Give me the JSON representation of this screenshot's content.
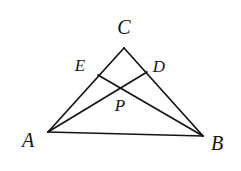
{
  "figure": {
    "type": "geometry-diagram",
    "background_color": "#ffffff",
    "ink_color": "#141414",
    "stroke_width": 1.7,
    "canvas": {
      "width": 241,
      "height": 171
    },
    "points": {
      "A": {
        "label": "A",
        "x": 48,
        "y": 132,
        "label_x": 28,
        "label_y": 140
      },
      "B": {
        "label": "B",
        "x": 203,
        "y": 136,
        "label_x": 217,
        "label_y": 143
      },
      "C": {
        "label": "C",
        "x": 124,
        "y": 48,
        "label_x": 124,
        "label_y": 27
      },
      "D": {
        "label": "D",
        "x": 147,
        "y": 72,
        "label_x": 159,
        "label_y": 66
      },
      "E": {
        "label": "E",
        "x": 98,
        "y": 75,
        "label_x": 80,
        "label_y": 65
      },
      "P": {
        "label": "P",
        "x": 124,
        "y": 90,
        "label_x": 120,
        "label_y": 105
      }
    },
    "segments": [
      {
        "name": "side-AB",
        "from": "A",
        "to": "B"
      },
      {
        "name": "side-AC",
        "from": "A",
        "to": "C"
      },
      {
        "name": "side-BC",
        "from": "B",
        "to": "C"
      },
      {
        "name": "cevian-AD",
        "from": "A",
        "to": "D"
      },
      {
        "name": "cevian-BE",
        "from": "B",
        "to": "E"
      }
    ],
    "labels_order": [
      "C",
      "E",
      "D",
      "P",
      "A",
      "B"
    ]
  }
}
